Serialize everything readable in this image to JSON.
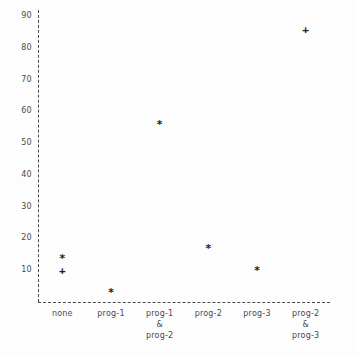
{
  "chart_data": {
    "type": "scatter",
    "title": "",
    "xlabel": "",
    "ylabel": "",
    "grid": false,
    "legend": "none",
    "ylim": [
      0,
      93
    ],
    "yticks": [
      90,
      80,
      70,
      60,
      50,
      40,
      30,
      20,
      10
    ],
    "ytick_labels": [
      "90",
      "80",
      "70",
      "60",
      "50",
      "40",
      "30",
      "20",
      "10"
    ],
    "categories": [
      "none",
      "prog-1",
      "prog-1\n&\nprog-2",
      "prog-2",
      "prog-3",
      "prog-2\n&\nprog-3"
    ],
    "series": [
      {
        "name": "asterisk",
        "marker": "*",
        "points": [
          {
            "category": "none",
            "value": 14
          },
          {
            "category": "prog-1",
            "value": 3
          },
          {
            "category": "prog-1\n&\nprog-2",
            "value": 56
          },
          {
            "category": "prog-2",
            "value": 17
          },
          {
            "category": "prog-3",
            "value": 10
          }
        ]
      },
      {
        "name": "plus",
        "marker": "+",
        "points": [
          {
            "category": "none",
            "value": 10
          },
          {
            "category": "prog-2\n&\nprog-3",
            "value": 86
          }
        ]
      }
    ]
  }
}
